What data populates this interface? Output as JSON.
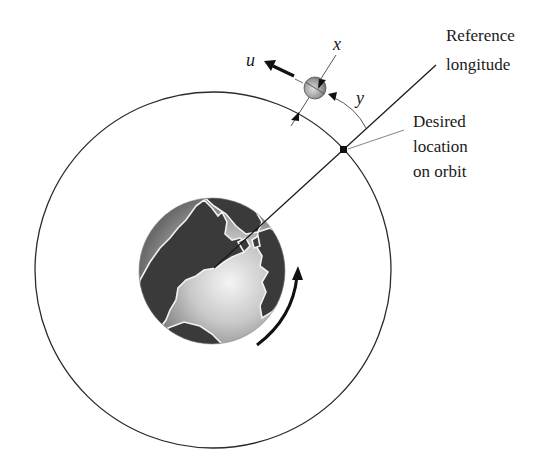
{
  "diagram": {
    "labels": {
      "reference_longitude": [
        "Reference",
        "longitude"
      ],
      "desired_location": [
        "Desired",
        "location",
        "on orbit"
      ],
      "x_axis": "x",
      "y_axis": "y",
      "control_input": "u"
    },
    "elements": {
      "orbit": {
        "cx": 213,
        "cy": 270,
        "r": 178
      },
      "earth": {
        "cx": 212,
        "cy": 271,
        "r": 73
      },
      "satellite": {
        "cx": 315,
        "cy": 88,
        "r": 11
      },
      "desired_point": {
        "x": 344,
        "y": 150
      },
      "reference_line": {
        "x1": 214,
        "y1": 268,
        "x2": 436,
        "y2": 65
      }
    },
    "colors": {
      "line": "#222222",
      "leader": "#777777",
      "earth_land": "#3a3a3a",
      "earth_ocean_light": "#eeeeee",
      "earth_ocean_dark": "#6a6a6a"
    }
  }
}
